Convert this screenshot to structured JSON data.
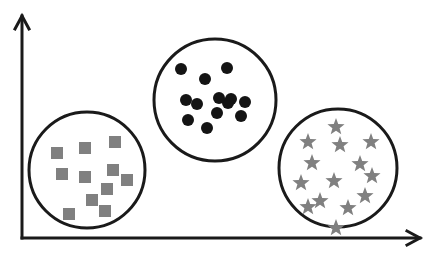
{
  "figure": {
    "title": "Clustering scatter diagram with three labeled groups",
    "width": 432,
    "height": 261,
    "background_color": "#ffffff",
    "stroke_color": "#1a1a1a",
    "marker_gray": "#808080",
    "marker_black": "#141414"
  },
  "axes": {
    "x_axis": {
      "name": "x-axis",
      "label": "",
      "tick_labels": [],
      "start": [
        22,
        238
      ],
      "end": [
        420,
        238
      ],
      "arrow": "right",
      "stroke_width": 3
    },
    "y_axis": {
      "name": "y-axis",
      "label": "",
      "tick_labels": [],
      "start": [
        22,
        238
      ],
      "end": [
        22,
        16
      ],
      "arrow": "up",
      "stroke_width": 3
    },
    "grid": false,
    "legend": null
  },
  "chart_data": {
    "type": "scatter",
    "title": "",
    "xlabel": "",
    "ylabel": "",
    "xlim": [
      0,
      432
    ],
    "ylim": [
      0,
      261
    ],
    "grid": false,
    "legend": null,
    "annotations": [],
    "cluster_count": 3,
    "clusters": [
      {
        "name": "cluster-squares",
        "marker": "square",
        "marker_color": "#808080",
        "marker_size": 12,
        "count": 11,
        "boundary": {
          "shape": "circle",
          "cx": 87,
          "cy": 170,
          "r": 58,
          "stroke": "#1a1a1a",
          "stroke_width": 3,
          "fill": "none"
        },
        "points": [
          [
            57,
            153
          ],
          [
            85,
            148
          ],
          [
            115,
            142
          ],
          [
            107,
            189
          ],
          [
            62,
            174
          ],
          [
            85,
            177
          ],
          [
            113,
            170
          ],
          [
            127,
            180
          ],
          [
            92,
            200
          ],
          [
            69,
            214
          ],
          [
            105,
            211
          ]
        ]
      },
      {
        "name": "cluster-dots",
        "marker": "circle",
        "marker_color": "#141414",
        "marker_size": 12,
        "count": 13,
        "boundary": {
          "shape": "circle",
          "cx": 215,
          "cy": 100,
          "r": 61,
          "stroke": "#1a1a1a",
          "stroke_width": 3,
          "fill": "none"
        },
        "points": [
          [
            181,
            69
          ],
          [
            205,
            79
          ],
          [
            227,
            68
          ],
          [
            231,
            99
          ],
          [
            186,
            100
          ],
          [
            197,
            104
          ],
          [
            217,
            113
          ],
          [
            228,
            103
          ],
          [
            245,
            102
          ],
          [
            241,
            116
          ],
          [
            188,
            120
          ],
          [
            207,
            128
          ],
          [
            219,
            98
          ]
        ]
      },
      {
        "name": "cluster-stars",
        "marker": "star",
        "marker_color": "#808080",
        "marker_size": 13,
        "count": 14,
        "boundary": {
          "shape": "circle",
          "cx": 338,
          "cy": 168,
          "r": 59,
          "stroke": "#1a1a1a",
          "stroke_width": 3,
          "fill": "none"
        },
        "points": [
          [
            336,
            127
          ],
          [
            308,
            142
          ],
          [
            340,
            145
          ],
          [
            371,
            142
          ],
          [
            312,
            163
          ],
          [
            360,
            164
          ],
          [
            301,
            183
          ],
          [
            334,
            181
          ],
          [
            320,
            201
          ],
          [
            365,
            196
          ],
          [
            348,
            208
          ],
          [
            308,
            207
          ],
          [
            336,
            228
          ],
          [
            372,
            176
          ]
        ]
      }
    ]
  }
}
